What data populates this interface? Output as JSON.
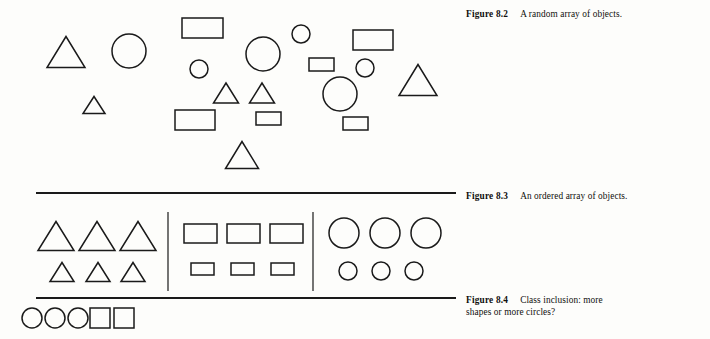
{
  "page": {
    "background_color": "#fdfdfb",
    "ink_color": "#1a1a1a",
    "width": 710,
    "height": 339
  },
  "captions": [
    {
      "id": "fig-8-2",
      "label": "Figure 8.2",
      "text": "A random array of objects."
    },
    {
      "id": "fig-8-3",
      "label": "Figure 8.3",
      "text": "An ordered array of objects."
    },
    {
      "id": "fig-8-4",
      "label": "Figure 8.4",
      "text": "Class inclusion: more shapes or more circles?"
    }
  ],
  "rules": [
    {
      "name": "divider-upper",
      "x1": 36,
      "y1": 193,
      "x2": 456,
      "y2": 193,
      "width": 2.1
    },
    {
      "name": "divider-lower",
      "x1": 36,
      "y1": 298,
      "x2": 456,
      "y2": 298,
      "width": 2.1
    },
    {
      "name": "column-divider-left",
      "x1": 168,
      "y1": 212,
      "x2": 168,
      "y2": 291,
      "width": 1.2
    },
    {
      "name": "column-divider-right",
      "x1": 313,
      "y1": 212,
      "x2": 313,
      "y2": 291,
      "width": 1.2
    }
  ],
  "figures": {
    "random_array": {
      "name": "Figure 8.2 random array",
      "counts": {
        "triangles": 7,
        "circles": 7,
        "rectangles": 6,
        "total": 20
      },
      "shapes": [
        {
          "type": "triangle",
          "cx": 66,
          "cy": 52,
          "w": 38,
          "h": 31,
          "size": "large"
        },
        {
          "type": "circle",
          "cx": 129,
          "cy": 51,
          "r": 17,
          "size": "large"
        },
        {
          "type": "rect",
          "x": 182,
          "y": 18,
          "w": 41,
          "h": 20,
          "size": "large"
        },
        {
          "type": "circle",
          "cx": 199,
          "cy": 69,
          "r": 9,
          "size": "small"
        },
        {
          "type": "circle",
          "cx": 263,
          "cy": 54,
          "r": 17,
          "size": "large"
        },
        {
          "type": "circle",
          "cx": 301,
          "cy": 34,
          "r": 9,
          "size": "small"
        },
        {
          "type": "rect",
          "x": 353,
          "y": 30,
          "w": 40,
          "h": 20,
          "size": "large"
        },
        {
          "type": "triangle",
          "cx": 226,
          "cy": 93,
          "w": 25,
          "h": 20,
          "size": "medium"
        },
        {
          "type": "triangle",
          "cx": 262,
          "cy": 93,
          "w": 25,
          "h": 20,
          "size": "medium"
        },
        {
          "type": "circle",
          "cx": 340,
          "cy": 94,
          "r": 17,
          "size": "large"
        },
        {
          "type": "circle",
          "cx": 365,
          "cy": 68,
          "r": 9,
          "size": "small"
        },
        {
          "type": "triangle",
          "cx": 418,
          "cy": 80,
          "w": 38,
          "h": 31,
          "size": "large"
        },
        {
          "type": "rect",
          "x": 309,
          "y": 58,
          "w": 25,
          "h": 13,
          "size": "small"
        },
        {
          "type": "triangle",
          "cx": 94,
          "cy": 105,
          "w": 22,
          "h": 17,
          "size": "small"
        },
        {
          "type": "rect",
          "x": 175,
          "y": 110,
          "w": 40,
          "h": 20,
          "size": "large"
        },
        {
          "type": "rect",
          "x": 256,
          "y": 112,
          "w": 25,
          "h": 13,
          "size": "small"
        },
        {
          "type": "rect",
          "x": 343,
          "y": 117,
          "w": 25,
          "h": 13,
          "size": "small"
        },
        {
          "type": "triangle",
          "cx": 242,
          "cy": 155,
          "w": 33,
          "h": 27,
          "size": "large"
        },
        {
          "type": "triangle",
          "cx": 258,
          "cy": 88,
          "w": 1,
          "h": 1,
          "size": "hidden"
        },
        {
          "type": "circle",
          "cx": 263,
          "cy": 54,
          "r": 0,
          "size": "hidden"
        }
      ]
    },
    "ordered_array": {
      "name": "Figure 8.3 ordered array",
      "groups": [
        {
          "name": "triangle-group",
          "shape": "triangle",
          "rows": [
            {
              "size": "large",
              "count": 3,
              "w": 36,
              "h": 29,
              "cy": 236,
              "xs": [
                56,
                97,
                138
              ]
            },
            {
              "size": "small",
              "count": 3,
              "w": 24,
              "h": 19,
              "cy": 272,
              "xs": [
                62,
                98,
                133
              ]
            }
          ]
        },
        {
          "name": "rectangle-group",
          "shape": "rect",
          "rows": [
            {
              "size": "large",
              "count": 3,
              "w": 33,
              "h": 19,
              "y": 224,
              "xs": [
                184,
                227,
                270
              ]
            },
            {
              "size": "small",
              "count": 3,
              "w": 23,
              "h": 12,
              "y": 263,
              "xs": [
                191,
                231,
                271
              ]
            }
          ]
        },
        {
          "name": "circle-group",
          "shape": "circle",
          "rows": [
            {
              "size": "large",
              "count": 3,
              "r": 15,
              "cy": 233,
              "xs": [
                344,
                385,
                426
              ]
            },
            {
              "size": "small",
              "count": 3,
              "r": 9,
              "cy": 271,
              "xs": [
                348,
                381,
                414
              ]
            }
          ]
        }
      ]
    },
    "class_inclusion": {
      "name": "Figure 8.4 class inclusion row",
      "counts": {
        "circles": 3,
        "squares": 2,
        "total": 5
      },
      "shapes": [
        {
          "type": "circle",
          "cx": 32,
          "cy": 318,
          "r": 10
        },
        {
          "type": "circle",
          "cx": 55,
          "cy": 318,
          "r": 10
        },
        {
          "type": "circle",
          "cx": 78,
          "cy": 318,
          "r": 10
        },
        {
          "type": "rect",
          "x": 90,
          "y": 308,
          "w": 20,
          "h": 20
        },
        {
          "type": "rect",
          "x": 114,
          "y": 308,
          "w": 20,
          "h": 20
        }
      ]
    }
  }
}
